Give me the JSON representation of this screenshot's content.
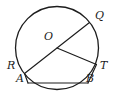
{
  "figure": {
    "kind": "circle-geometry-diagram",
    "background_color": "#ffffff",
    "stroke_color": "#1c1c1c",
    "canvas": {
      "width": 113,
      "height": 97
    },
    "circle": {
      "center_x": 57,
      "center_y": 48,
      "radius": 41.5,
      "label": "circle"
    },
    "points": {
      "O": {
        "label": "O",
        "x": 57,
        "y": 48,
        "label_x": 44,
        "label_y": 31,
        "on_circle": false,
        "role": "center"
      },
      "Q": {
        "label": "Q",
        "x": 89.5,
        "y": 22.5,
        "label_x": 95,
        "label_y": 10,
        "on_circle": true,
        "role": "endpoint-of-diameter"
      },
      "R": {
        "label": "R",
        "x": 24.5,
        "y": 73.5,
        "label_x": 7,
        "label_y": 60,
        "on_circle": true,
        "role": "endpoint-of-diameter"
      },
      "T": {
        "label": "T",
        "x": 96.5,
        "y": 64.5,
        "label_x": 96,
        "label_y": 60,
        "on_circle": true,
        "role": "endpoint-of-radius"
      },
      "A": {
        "label": "A",
        "x": 28,
        "y": 83,
        "label_x": 14,
        "label_y": 72,
        "on_circle": true,
        "role": "endpoint-of-chord"
      },
      "B": {
        "label": "B",
        "x": 88,
        "y": 83,
        "label_x": 86,
        "label_y": 72,
        "on_circle": true,
        "role": "endpoint-of-chord"
      }
    },
    "segments": [
      {
        "name": "diameter-RQ",
        "from": "R",
        "to": "Q",
        "through_center": true
      },
      {
        "name": "radius-OT",
        "from": "O",
        "to": "T",
        "through_center": false
      },
      {
        "name": "chord-AB",
        "from": "A",
        "to": "B",
        "through_center": false
      },
      {
        "name": "segment-RA",
        "from": "R",
        "to": "A",
        "through_center": false
      },
      {
        "name": "segment-TB",
        "from": "T",
        "to": "B",
        "through_center": false
      }
    ],
    "labels": {
      "O": "O",
      "Q": "Q",
      "R": "R",
      "T": "T",
      "A": "A",
      "B": "B"
    }
  }
}
